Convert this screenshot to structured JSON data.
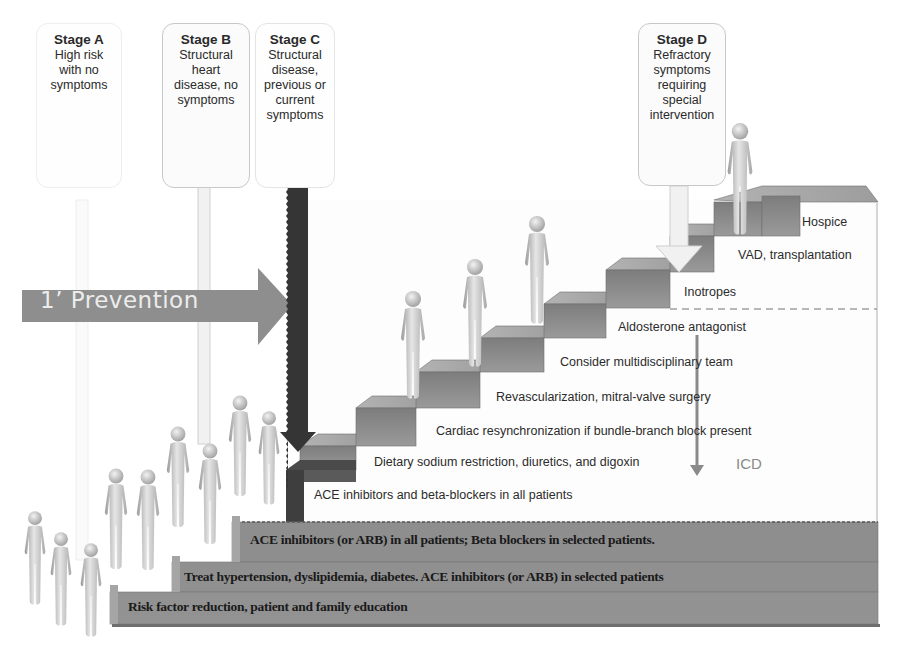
{
  "stages": [
    {
      "id": "A",
      "title": "Stage A",
      "description": "High risk\nwith no\nsymptoms"
    },
    {
      "id": "B",
      "title": "Stage B",
      "description": "Structural\nheart\ndisease, no\nsymptoms"
    },
    {
      "id": "C",
      "title": "Stage C",
      "description": "Structural\ndisease,\nprevious or\ncurrent\nsymptoms"
    },
    {
      "id": "D",
      "title": "Stage D",
      "description": "Refractory\nsymptoms\nrequiring\nspecial\nintervention"
    }
  ],
  "prevention_arrow": {
    "label": "1’ Prevention"
  },
  "stair_steps": [
    {
      "label": "ACE inhibitors and beta-blockers in all patients"
    },
    {
      "label": "Dietary sodium restriction, diuretics, and digoxin"
    },
    {
      "label": "Cardiac resynchronization if bundle-branch block present"
    },
    {
      "label": "Revascularization, mitral-valve surgery"
    },
    {
      "label": "Consider multidisciplinary team"
    },
    {
      "label": "Aldosterone antagonist"
    },
    {
      "label": "Inotropes"
    },
    {
      "label": "VAD, transplantation"
    },
    {
      "label": "Hospice"
    }
  ],
  "icd_arrow": {
    "label": "ICD"
  },
  "base_steps": [
    {
      "label": "ACE inhibitors (or ARB) in all patients; Beta blockers in selected patients."
    },
    {
      "label": "Treat hypertension, dyslipidemia, diabetes.  ACE inhibitors (or ARB) in selected patients"
    },
    {
      "label": "Risk factor reduction, patient and family education"
    }
  ],
  "colors": {
    "step_face": "#8c8c8c",
    "step_top": "#a9a9a9",
    "base_fill": "#8f8f8f",
    "dark_arrow": "#3a3a3a",
    "prevention_arrow": "#8e8e8e",
    "background": "#ffffff"
  }
}
